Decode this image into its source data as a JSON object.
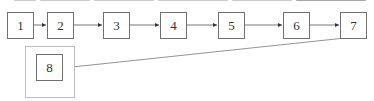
{
  "diagram": {
    "type": "flowchart",
    "nodes": [
      {
        "id": "1",
        "label": "1"
      },
      {
        "id": "2",
        "label": "2"
      },
      {
        "id": "3",
        "label": "3"
      },
      {
        "id": "4",
        "label": "4"
      },
      {
        "id": "5",
        "label": "5"
      },
      {
        "id": "6",
        "label": "6"
      },
      {
        "id": "7",
        "label": "7"
      },
      {
        "id": "8",
        "label": "8"
      }
    ],
    "edges": [
      {
        "from": "1",
        "to": "2"
      },
      {
        "from": "2",
        "to": "3"
      },
      {
        "from": "3",
        "to": "4"
      },
      {
        "from": "4",
        "to": "5"
      },
      {
        "from": "5",
        "to": "6"
      },
      {
        "from": "6",
        "to": "7"
      },
      {
        "from": "7",
        "to": "8"
      }
    ],
    "group": {
      "contains": [
        "8"
      ]
    },
    "colors": {
      "node_border": "#6f6f6f",
      "group_border": "#bdbdbd",
      "edge": "#555555"
    }
  }
}
